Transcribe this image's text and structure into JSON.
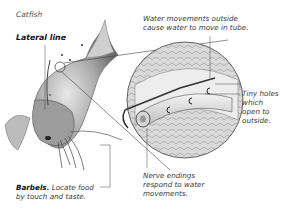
{
  "diagram": {
    "title": "Catfish",
    "labels": {
      "lateral_line": "Lateral line",
      "water_movements": [
        "Water movements outside",
        "cause water to move in tube."
      ],
      "tiny_holes": [
        "Tiny holes",
        "which",
        "open to",
        "outside."
      ],
      "nerve_endings": [
        "Nerve endings",
        "respond to water",
        "movements."
      ],
      "barbels_bold": "Barbels.",
      "barbels_text": [
        "Locate food",
        "by touch and taste."
      ]
    },
    "colors": {
      "background": "#ffffff",
      "ink": "#3a3a3a",
      "fish_shading": "#8a8a8a",
      "leader_lines": "#444444"
    }
  }
}
